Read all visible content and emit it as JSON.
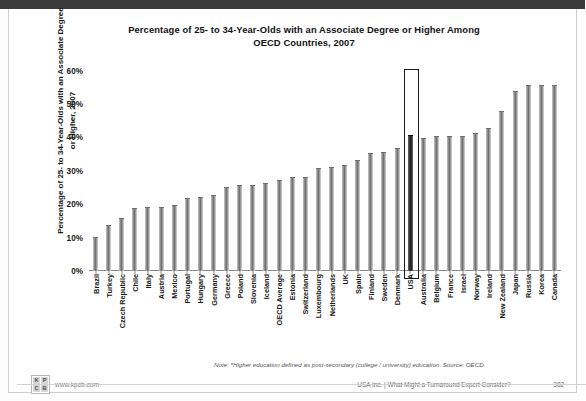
{
  "slide": {
    "title": "Percentage of 25- to 34-Year-Olds with an Associate Degree or Higher Among OECD Countries, 2007",
    "title_line1": "Percentage of 25- to 34-Year-Olds with an Associate Degree or Higher Among",
    "title_line2": "OECD Countries, 2007",
    "note": "Note: *Higher education defined as post-secondary (college / university) education. Source: OECD.",
    "footer_center": "USA Inc. | What Might a Turnaround Expert Consider?",
    "page_number": "382",
    "logo_letters": [
      "K",
      "P",
      "C",
      "B"
    ],
    "logo_url": "www.kpcb.com"
  },
  "chart_data": {
    "type": "bar",
    "title": "Percentage of 25- to 34-Year-Olds with an Associate Degree or Higher Among OECD Countries, 2007",
    "xlabel": "",
    "ylabel": "Percentage of 25- to 34-Year-Olds with an Associate Degree or Higher, 2007",
    "ylim": [
      0,
      65
    ],
    "ytick_labels": [
      "60%",
      "50%",
      "40%",
      "30%",
      "20%",
      "10%",
      "0%"
    ],
    "ytick_values": [
      60,
      50,
      40,
      30,
      20,
      10,
      0
    ],
    "grid": false,
    "legend": null,
    "highlight": "USA",
    "categories": [
      "Brazil",
      "Turkey",
      "Czech Republic",
      "Chile",
      "Italy",
      "Austria",
      "Mexico",
      "Portugal",
      "Hungary",
      "Germany",
      "Greece",
      "Poland",
      "Slovenia",
      "Iceland",
      "OECD Average",
      "Estonia",
      "Switzerland",
      "Luxembourg",
      "Netherlands",
      "UK",
      "Spain",
      "Finland",
      "Sweden",
      "Denmark",
      "USA",
      "Australia",
      "Belgium",
      "France",
      "Israel",
      "Norway",
      "Ireland",
      "New Zealand",
      "Japan",
      "Russia",
      "Korea",
      "Canada"
    ],
    "values": [
      10,
      13.5,
      15.5,
      18.5,
      19,
      19,
      19.5,
      21.5,
      22,
      22.5,
      25,
      25.5,
      25.5,
      26,
      27,
      28,
      28,
      30.5,
      31,
      31.5,
      33,
      35,
      35.5,
      36.5,
      40.5,
      39.5,
      40,
      40,
      40,
      41,
      42.5,
      47.5,
      53.5,
      55.5,
      55.5,
      55.5
    ]
  }
}
